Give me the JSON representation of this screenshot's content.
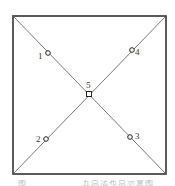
{
  "diagram": {
    "type": "five-point sampling layout",
    "square": {
      "x1": 13,
      "y1": 16,
      "x2": 166,
      "y2": 174
    },
    "points": [
      {
        "label": "1",
        "x": 48,
        "y": 53
      },
      {
        "label": "4",
        "x": 132,
        "y": 50
      },
      {
        "label": "5",
        "x": 89,
        "y": 94
      },
      {
        "label": "2",
        "x": 46,
        "y": 139
      },
      {
        "label": "3",
        "x": 130,
        "y": 137
      }
    ]
  },
  "caption": {
    "prefix": "图",
    "title": "五点法布点示意图"
  }
}
